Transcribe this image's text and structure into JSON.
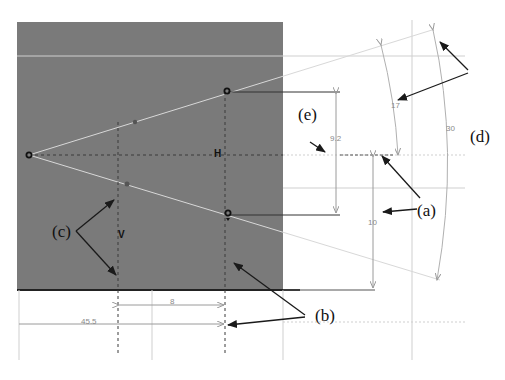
{
  "figure": {
    "panel_color": "#7a7a7a",
    "panel_border_color": "#222222",
    "background": "#ffffff",
    "construction_line_color": "#c8c8c8",
    "annotation_color": "#1a1a1a"
  },
  "dimensions": {
    "vertical_upper": "9.2",
    "vertical_lower": "10",
    "arc_inner": "17",
    "arc_outer": "30",
    "horizontal_short": "8",
    "horizontal_long": "45.5"
  },
  "constraint_glyphs": {
    "horizontal": "H",
    "vertical": "V"
  },
  "callouts": {
    "a": "(a)",
    "b": "(b)",
    "c": "(c)",
    "d": "(d)",
    "e": "(e)"
  }
}
